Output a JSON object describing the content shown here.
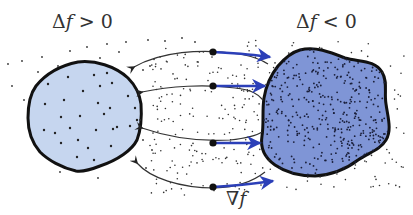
{
  "labels": {
    "left_region": "Δf > 0",
    "left_region_symbol": "Δ",
    "left_region_var": "f",
    "left_region_rel": " > 0",
    "right_region": "Δf < 0",
    "right_region_symbol": "Δ",
    "right_region_var": "f",
    "right_region_rel": " < 0",
    "gradient": "∇f",
    "gradient_symbol": "∇",
    "gradient_var": "f"
  },
  "colors": {
    "background": "#ffffff",
    "left_fill": "#c6d6ef",
    "right_fill": "#7f95d6",
    "outline": "#111111",
    "flow_line": "#333333",
    "gradient_arrow": "#2b3fb8",
    "particle": "#222222",
    "text": "#333333"
  },
  "diagram": {
    "left_region": {
      "name": "source region (Δf > 0)",
      "density": "sparse particles"
    },
    "right_region": {
      "name": "sink region (Δf < 0)",
      "density": "dense particles"
    },
    "sample_points": [
      {
        "x": 213,
        "y": 52
      },
      {
        "x": 213,
        "y": 86
      },
      {
        "x": 213,
        "y": 143
      },
      {
        "x": 213,
        "y": 187
      }
    ],
    "flow_curves": 4,
    "gradient_arrows": 4
  }
}
